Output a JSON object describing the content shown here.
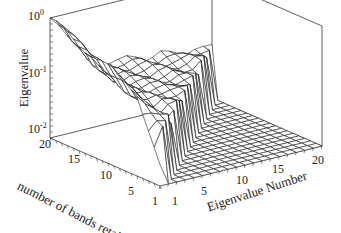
{
  "chart_data": {
    "type": "surface3d",
    "title": "",
    "zlabel": "Eigenvalue",
    "xlabel": "Eigenvalue Number",
    "ylabel": "number of bands retained",
    "zscale": "log",
    "zlim": [
      0.01,
      1
    ],
    "z_ticks": [
      "10^0",
      "10^-1",
      "10^-2"
    ],
    "x_ticks": [
      "1",
      "5",
      "10",
      "15",
      "20"
    ],
    "y_ticks": [
      "1",
      "5",
      "10",
      "15",
      "20"
    ],
    "x_range": [
      1,
      20
    ],
    "y_range": [
      1,
      20
    ],
    "grid": false,
    "legend": null,
    "series": [
      {
        "name": "bands=1",
        "values": [
          0.02,
          0.01,
          0.01,
          0.01,
          0.01,
          0.01,
          0.01,
          0.01,
          0.01,
          0.01,
          0.01,
          0.01,
          0.01,
          0.01,
          0.01,
          0.01,
          0.01,
          0.01,
          0.01,
          0.01
        ]
      },
      {
        "name": "bands=5",
        "values": [
          0.25,
          0.15,
          0.1,
          0.08,
          0.06,
          0.01,
          0.01,
          0.01,
          0.01,
          0.01,
          0.01,
          0.01,
          0.01,
          0.01,
          0.01,
          0.01,
          0.01,
          0.01,
          0.01,
          0.01
        ]
      },
      {
        "name": "bands=10",
        "values": [
          0.4,
          0.25,
          0.15,
          0.12,
          0.1,
          0.09,
          0.08,
          0.08,
          0.07,
          0.07,
          0.01,
          0.01,
          0.01,
          0.01,
          0.01,
          0.01,
          0.01,
          0.01,
          0.01,
          0.01
        ]
      },
      {
        "name": "bands=15",
        "values": [
          0.6,
          0.4,
          0.25,
          0.15,
          0.12,
          0.1,
          0.1,
          0.09,
          0.09,
          0.08,
          0.08,
          0.08,
          0.07,
          0.07,
          0.07,
          0.01,
          0.01,
          0.01,
          0.01,
          0.01
        ]
      },
      {
        "name": "bands=20",
        "values": [
          1.0,
          0.8,
          0.5,
          0.3,
          0.2,
          0.15,
          0.12,
          0.11,
          0.1,
          0.1,
          0.1,
          0.09,
          0.09,
          0.09,
          0.08,
          0.08,
          0.08,
          0.08,
          0.07,
          0.07
        ]
      }
    ]
  },
  "labels": {
    "z_axis_title": "Eigenvalue",
    "x_axis_title": "Eigenvalue Number",
    "y_axis_title": "number of bands retained",
    "z_tick_top_base": "10",
    "z_tick_top_exp": "0",
    "z_tick_mid_base": "10",
    "z_tick_mid_exp": "-1",
    "z_tick_bot_base": "10",
    "z_tick_bot_exp": "-2",
    "y_tick_20": "20",
    "y_tick_15": "15",
    "y_tick_10": "10",
    "y_tick_5": "5",
    "y_tick_1": "1",
    "x_tick_1": "1",
    "x_tick_5": "5",
    "x_tick_10": "10",
    "x_tick_15": "15",
    "x_tick_20": "20"
  }
}
